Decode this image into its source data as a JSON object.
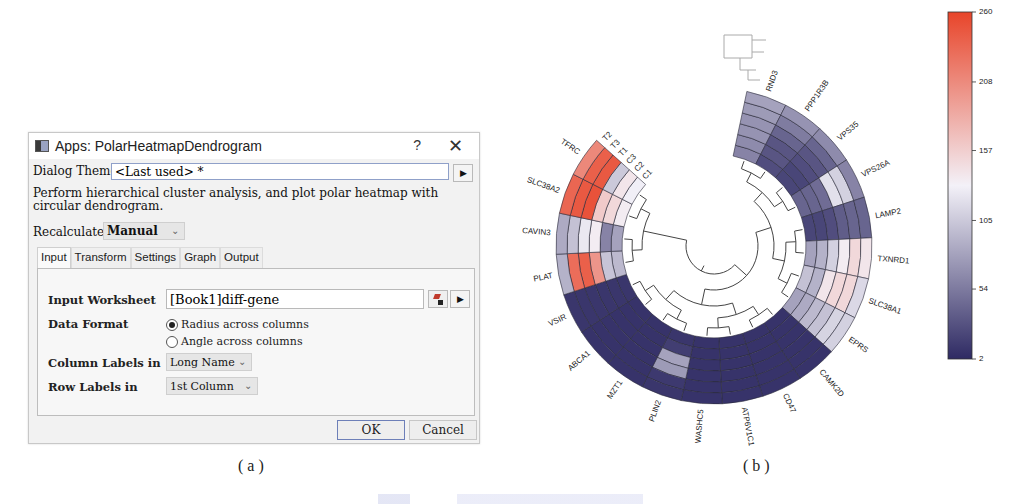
{
  "dialog": {
    "title": "Apps: PolarHeatmapDendrogram",
    "help_label": "?",
    "close_label": "✕",
    "theme_label": "Dialog Theme",
    "theme_value": "<Last used> *",
    "theme_arrow": "▶",
    "description": "Perform hierarchical cluster analysis, and plot polar heatmap with circular dendrogram.",
    "recalculate_label": "Recalculate",
    "recalculate_value": "Manual",
    "tabs": [
      {
        "label": "Input",
        "active": true
      },
      {
        "label": "Transform",
        "active": false
      },
      {
        "label": "Settings",
        "active": false
      },
      {
        "label": "Graph",
        "active": false
      },
      {
        "label": "Output",
        "active": false
      }
    ],
    "input_tab": {
      "worksheet_label": "Input Worksheet",
      "worksheet_value": "[Book1]diff-gene",
      "worksheet_arrow": "▶",
      "data_format_label": "Data Format",
      "data_format_options": [
        {
          "label": "Radius across columns",
          "selected": true
        },
        {
          "label": "Angle across columns",
          "selected": false
        }
      ],
      "column_labels_label": "Column Labels in",
      "column_labels_value": "Long Name",
      "row_labels_label": "Row Labels in",
      "row_labels_value": "1st Column"
    },
    "ok_label": "OK",
    "cancel_label": "Cancel",
    "chevron": "⌄"
  },
  "captions": {
    "a": "( a )",
    "b": "( b )"
  },
  "chart_data": {
    "type": "heatmap",
    "subtype": "polar heatmap with circular dendrogram",
    "title": "",
    "rings_outer_to_inner": [
      "T2",
      "T3",
      "T1",
      "C3",
      "C2",
      "C1"
    ],
    "genes_clockwise_from_top": [
      "RND3",
      "PPP1R3B",
      "VPS35",
      "VPS26A",
      "LAMP2",
      "TXNRD1",
      "SLC38A1",
      "EPRS",
      "CAMK2D",
      "CD47",
      "ATP6V1C1",
      "WASHC5",
      "PLIN2",
      "MZT1",
      "ABCA1",
      "VSIR",
      "PLAT",
      "CAVIN3",
      "SLC38A2",
      "TFRC"
    ],
    "values_by_ring": {
      "T2": [
        80,
        70,
        65,
        60,
        40,
        140,
        115,
        110,
        8,
        8,
        8,
        8,
        10,
        8,
        8,
        10,
        90,
        85,
        235,
        210
      ],
      "T3": [
        75,
        55,
        40,
        110,
        40,
        150,
        150,
        112,
        8,
        8,
        8,
        8,
        12,
        8,
        8,
        10,
        230,
        100,
        245,
        240
      ],
      "T1": [
        70,
        40,
        30,
        120,
        35,
        135,
        150,
        100,
        8,
        8,
        8,
        8,
        75,
        8,
        8,
        10,
        240,
        125,
        250,
        245
      ],
      "C3": [
        70,
        30,
        25,
        45,
        25,
        110,
        140,
        95,
        8,
        8,
        8,
        8,
        80,
        8,
        8,
        10,
        200,
        135,
        160,
        105
      ],
      "C2": [
        65,
        30,
        20,
        40,
        20,
        90,
        90,
        85,
        8,
        8,
        8,
        8,
        15,
        8,
        8,
        10,
        102,
        60,
        150,
        140
      ],
      "C1": [
        60,
        25,
        20,
        40,
        20,
        80,
        100,
        80,
        8,
        8,
        8,
        8,
        10,
        8,
        8,
        10,
        95,
        80,
        135,
        130
      ]
    },
    "colorbar": {
      "min": 2,
      "max": 260,
      "ticks": [
        260,
        208,
        157,
        105,
        54,
        2
      ],
      "low_color": "#2e2a63",
      "mid_color": "#f3f1f8",
      "high_color": "#e8452a"
    },
    "dendrogram": "circular, drawn inside the ring"
  }
}
